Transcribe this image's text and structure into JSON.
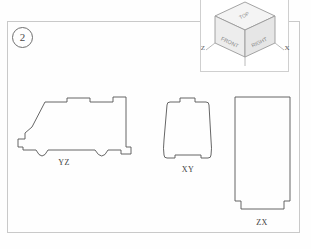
{
  "sheet": {
    "item_number": "2",
    "border_color": "#c9c9c9"
  },
  "viewcube": {
    "name": "view-cube",
    "faces": {
      "top": "TOP",
      "front": "FRONT",
      "right": "RIGHT"
    },
    "axes": {
      "left": "Z",
      "right": "X"
    },
    "face_color": "#f2f2f2",
    "line_color": "#9a9a9a"
  },
  "views": [
    {
      "id": "yz",
      "label": "YZ",
      "description": "side-profile-silhouette-of-vehicle-with-two-wheel-arches"
    },
    {
      "id": "xy",
      "label": "XY",
      "description": "front-elevation-trapezoid-with-top-center-notch"
    },
    {
      "id": "zx",
      "label": "ZX",
      "description": "plan-view-tall-rectangle-with-bottom-corner-notches"
    }
  ],
  "style": {
    "outline_color": "#555555",
    "label_color": "#3d3d3d",
    "background": "#fefefe"
  }
}
